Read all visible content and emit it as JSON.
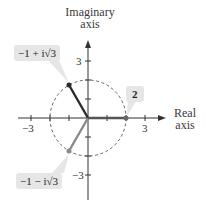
{
  "diagram": {
    "type": "complex-plane",
    "axes": {
      "imaginary_label_line1": "Imaginary",
      "imaginary_label_line2": "axis",
      "real_label_line1": "Real",
      "real_label_line2": "axis"
    },
    "ticks": {
      "real_neg": "−3",
      "real_pos": "3",
      "imag_pos": "3",
      "imag_neg": "−3"
    },
    "circle_radius": 2,
    "points": [
      {
        "label": "−1 + i√3",
        "re": -1,
        "im": 1.732,
        "color": "#2b2b2b"
      },
      {
        "label": "−1 − i√3",
        "re": -1,
        "im": -1.732,
        "color": "#8a8a8a"
      },
      {
        "label": "2",
        "re": 2,
        "im": 0,
        "color": "#555555"
      }
    ],
    "colors": {
      "callout_bg": "#e6e6e6",
      "axis": "#333333",
      "circle": "#555555"
    }
  }
}
